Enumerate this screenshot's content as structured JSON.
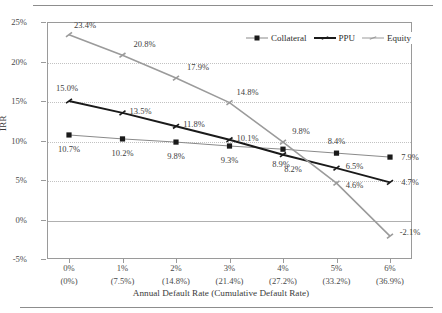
{
  "chart_data": {
    "type": "line",
    "title": "",
    "xlabel": "Annual Default Rate (Cumulative Default Rate)",
    "ylabel": "IRR",
    "categories": [
      "0%",
      "1%",
      "2%",
      "3%",
      "4%",
      "5%",
      "6%"
    ],
    "category_sublabels": [
      "(0%)",
      "(7.5%)",
      "(14.8%)",
      "(21.4%)",
      "(27.2%)",
      "(33.2%)",
      "(36.9%)"
    ],
    "x": [
      0,
      1,
      2,
      3,
      4,
      5,
      6
    ],
    "ylim": [
      -5,
      25
    ],
    "yticks": [
      25,
      20,
      15,
      10,
      5,
      0,
      -5
    ],
    "ytick_labels": [
      "25%",
      "20%",
      "15%",
      "10%",
      "5%",
      "0%",
      "-5%"
    ],
    "grid": "horizontal-dotted",
    "legend_position": "top-right-inside",
    "series": [
      {
        "name": "Collateral",
        "color": "#8a8a8a",
        "marker": "square",
        "marker_color": "#1a1a1a",
        "line_width": 1.0,
        "values": [
          10.7,
          10.2,
          9.8,
          9.3,
          8.9,
          8.4,
          7.9
        ],
        "labels": [
          "10.7%",
          "10.2%",
          "9.8%",
          "9.3%",
          "8.9%",
          "8.4%",
          "7.9%"
        ]
      },
      {
        "name": "PPU",
        "color": "#1a1a1a",
        "marker": "tick",
        "marker_color": "#1a1a1a",
        "line_width": 2.0,
        "values": [
          15.0,
          13.5,
          11.8,
          10.1,
          8.2,
          6.5,
          4.7
        ],
        "labels": [
          "15.0%",
          "13.5%",
          "11.8%",
          "10.1%",
          "8.2%",
          "6.5%",
          "4.7%"
        ]
      },
      {
        "name": "Equity",
        "color": "#9b9b9b",
        "marker": "tick",
        "marker_color": "#9b9b9b",
        "line_width": 1.6,
        "values": [
          23.4,
          20.8,
          17.9,
          14.8,
          9.8,
          4.6,
          -2.1
        ],
        "labels": [
          "23.4%",
          "20.8%",
          "17.9%",
          "14.8%",
          "9.8%",
          "4.6%",
          "-2.1%"
        ]
      }
    ]
  },
  "label_offsets": {
    "Collateral": [
      [
        0,
        14
      ],
      [
        0,
        14
      ],
      [
        0,
        14
      ],
      [
        0,
        14
      ],
      [
        -2,
        15
      ],
      [
        0,
        -12
      ],
      [
        20,
        0
      ]
    ],
    "PPU": [
      [
        -2,
        -13
      ],
      [
        18,
        -2
      ],
      [
        18,
        -2
      ],
      [
        18,
        -2
      ],
      [
        10,
        14
      ],
      [
        18,
        -2
      ],
      [
        20,
        0
      ]
    ],
    "Equity": [
      [
        16,
        -10
      ],
      [
        22,
        -11
      ],
      [
        22,
        -11
      ],
      [
        18,
        -11
      ],
      [
        18,
        -11
      ],
      [
        18,
        2
      ],
      [
        20,
        -4
      ]
    ]
  }
}
